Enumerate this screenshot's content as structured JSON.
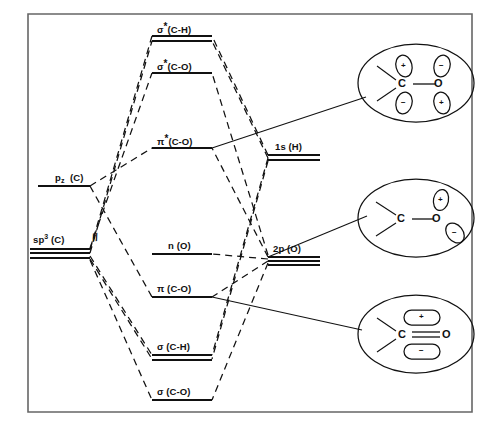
{
  "figure": {
    "type": "molecular-orbital-energy-diagram",
    "title": "",
    "caption": "",
    "border_color": "#555555",
    "line_color": "#111111"
  },
  "levels": {
    "left_column": [
      {
        "key": "pz_C",
        "label_html": "p<sub>z</sub> (C)",
        "label_text": "pz (C)",
        "sublevels": 1,
        "x": 38,
        "y": 182,
        "width": 52
      },
      {
        "key": "sp3_C",
        "label_html": "sp<sup>3</sup> (C)",
        "label_text": "sp3 (C)",
        "sublevels": 3,
        "x": 30,
        "y": 246,
        "width": 60
      }
    ],
    "center_column": [
      {
        "key": "sigma_star_CH",
        "label_text": "σ*(C-H)",
        "symbol": "σ",
        "star": true,
        "bond": "(C-H)",
        "sublevels": 2,
        "x": 152,
        "y": 33,
        "width": 60
      },
      {
        "key": "sigma_star_CO",
        "label_text": "σ*(C-O)",
        "symbol": "σ",
        "star": true,
        "bond": "(C-O)",
        "sublevels": 1,
        "x": 152,
        "y": 70,
        "width": 60
      },
      {
        "key": "pi_star_CO",
        "label_text": "π*(C-O)",
        "symbol": "π",
        "star": true,
        "bond": "(C-O)",
        "sublevels": 1,
        "x": 152,
        "y": 145,
        "width": 60
      },
      {
        "key": "n_O",
        "label_text": "n (O)",
        "symbol": "n",
        "star": false,
        "bond": "(O)",
        "sublevels": 1,
        "x": 152,
        "y": 251,
        "width": 60
      },
      {
        "key": "pi_CO",
        "label_text": "π (C-O)",
        "symbol": "π",
        "star": false,
        "bond": "(C-O)",
        "sublevels": 1,
        "x": 152,
        "y": 294,
        "width": 60
      },
      {
        "key": "sigma_CH",
        "label_text": "σ (C-H)",
        "symbol": "σ",
        "star": false,
        "bond": "(C-H)",
        "sublevels": 2,
        "x": 152,
        "y": 352,
        "width": 60
      },
      {
        "key": "sigma_CO",
        "label_text": "σ (C-O)",
        "symbol": "σ",
        "star": false,
        "bond": "(C-O)",
        "sublevels": 1,
        "x": 152,
        "y": 397,
        "width": 60
      }
    ],
    "right_column": [
      {
        "key": "1s_H",
        "label_text": "1s (H)",
        "sublevels": 2,
        "x": 268,
        "y": 151,
        "width": 52
      },
      {
        "key": "2p_O",
        "label_text": "2p (O)",
        "sublevels": 3,
        "x": 268,
        "y": 253,
        "width": 52
      }
    ]
  },
  "orbital_bubbles": [
    {
      "key": "pi_star_bubble",
      "connects_to": "pi_star_CO",
      "atoms": [
        "C",
        "O"
      ],
      "lobes": [
        {
          "on": "C",
          "position": "upper",
          "sign": "+"
        },
        {
          "on": "C",
          "position": "lower",
          "sign": "−"
        },
        {
          "on": "O",
          "position": "upper",
          "sign": "−"
        },
        {
          "on": "O",
          "position": "lower",
          "sign": "+"
        }
      ],
      "bond_order_drawn": "single-line",
      "cx": 416,
      "cy": 83,
      "rx": 58,
      "ry": 39
    },
    {
      "key": "n_bubble",
      "connects_to": "n_O",
      "atoms": [
        "C",
        "O"
      ],
      "lobes": [
        {
          "on": "O",
          "position": "upper",
          "sign": "+"
        },
        {
          "on": "O",
          "position": "lower-right",
          "sign": "−"
        }
      ],
      "bond_order_drawn": "single-line",
      "cx": 416,
      "cy": 218,
      "rx": 58,
      "ry": 39
    },
    {
      "key": "pi_bubble",
      "connects_to": "pi_CO",
      "atoms": [
        "C",
        "O"
      ],
      "lobes": [
        {
          "on": "C-O",
          "position": "upper",
          "sign": "+"
        },
        {
          "on": "C-O",
          "position": "lower",
          "sign": "−"
        }
      ],
      "bond_order_drawn": "double-line",
      "cx": 416,
      "cy": 334,
      "rx": 58,
      "ry": 39
    }
  ],
  "break_marks": [
    {
      "key": "sp3-break",
      "text": "//",
      "x": 92,
      "y": 236
    }
  ]
}
